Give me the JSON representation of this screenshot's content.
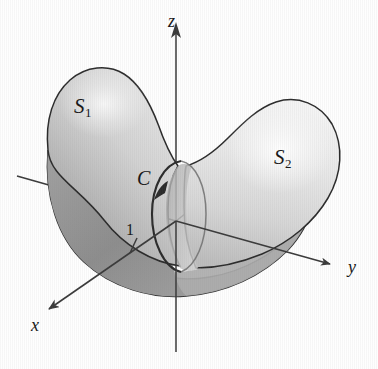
{
  "figure": {
    "kind": "3d-surface-diagram",
    "background_color": "#fefefe",
    "outline_color": "#2b2b2b",
    "axis_color": "#3a3a3a"
  },
  "labels": {
    "surface_1": {
      "base": "S",
      "subscript": "1",
      "name": "surface-label-s1"
    },
    "surface_2": {
      "base": "S",
      "subscript": "2",
      "name": "surface-label-s2"
    },
    "curve": {
      "text": "C",
      "name": "curve-label-c"
    },
    "tick": {
      "text": "1",
      "name": "axis-tick-label-one"
    },
    "axis_x": {
      "text": "x"
    },
    "axis_y": {
      "text": "y"
    },
    "axis_z": {
      "text": "z"
    }
  },
  "shading": {
    "surface_1_fill_light": "#d8d8d8",
    "surface_1_fill_dark": "#9c9c9c",
    "surface_2_fill_light": "#eeeeee",
    "surface_2_fill_dark": "#c3c3c3",
    "underside_fill": "#8e8e8e",
    "cylinder_fill": "#b4b4b4"
  },
  "geometry": {
    "origin": {
      "x": 176,
      "y": 221
    },
    "z_axis_top": {
      "x": 176,
      "y": 22
    },
    "z_axis_bottom": {
      "x": 176,
      "y": 352
    },
    "y_axis_tip": {
      "x": 340,
      "y": 267
    },
    "y_axis_tail": {
      "x": 17,
      "y": 176
    },
    "x_axis_tip": {
      "x": 43,
      "y": 313
    },
    "x_axis_tail": {
      "x": 241,
      "y": 170
    },
    "curve_center": {
      "x": 178,
      "y": 217
    },
    "curve_radius_x": 28,
    "curve_radius_y": 58,
    "curve_rotation_deg": -6
  }
}
